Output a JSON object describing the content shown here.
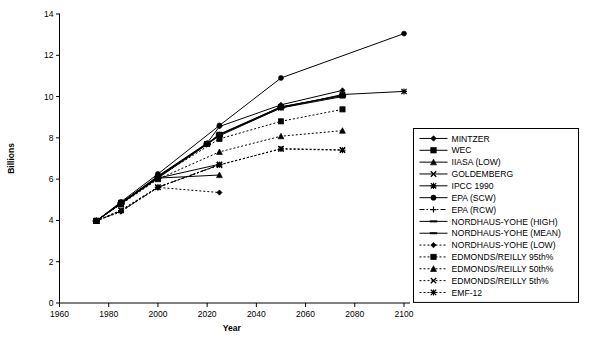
{
  "chart_data": {
    "type": "line",
    "title": "",
    "xlabel": "Year",
    "ylabel": "Billions",
    "xlim": [
      1960,
      2100
    ],
    "ylim": [
      0,
      14
    ],
    "xticks": [
      1960,
      1980,
      2000,
      2020,
      2040,
      2060,
      2080,
      2100
    ],
    "xtick_labels": [
      "1960",
      "1980",
      "2000",
      "2020",
      "2040",
      "2060",
      "2080",
      "2100"
    ],
    "yticks": [
      0,
      2,
      4,
      6,
      8,
      10,
      12,
      14
    ],
    "ytick_labels": [
      "0",
      "2",
      "4",
      "6",
      "8",
      "10",
      "12",
      "14"
    ],
    "grid": false,
    "legend_position": "right-outside",
    "series": [
      {
        "name": "MINTZER",
        "marker": "diamond",
        "dash": "solid",
        "x": [
          1975,
          1985,
          2000,
          2020,
          2025,
          2050,
          2075
        ],
        "values": [
          3.98,
          4.85,
          6.15,
          7.75,
          8.55,
          9.6,
          10.3
        ]
      },
      {
        "name": "WEC",
        "marker": "square",
        "dash": "solid",
        "x": [
          1975,
          1985,
          2000,
          2020,
          2025,
          2050,
          2075
        ],
        "values": [
          3.98,
          4.85,
          6.1,
          7.7,
          8.15,
          9.5,
          10.05
        ]
      },
      {
        "name": "IIASA (LOW)",
        "marker": "triangle",
        "dash": "solid",
        "x": [
          1975,
          1985,
          2000,
          2025
        ],
        "values": [
          3.98,
          4.82,
          6.05,
          6.2
        ]
      },
      {
        "name": "GOLDEMBERG",
        "marker": "x",
        "dash": "solid",
        "x": [
          1975,
          1985,
          2000,
          2025
        ],
        "values": [
          3.98,
          4.82,
          6.05,
          6.72
        ]
      },
      {
        "name": "IPCC 1990",
        "marker": "asterisk",
        "dash": "solid",
        "x": [
          1975,
          1985,
          2000,
          2020,
          2025,
          2050,
          2075,
          2100
        ],
        "values": [
          3.98,
          4.85,
          6.1,
          7.72,
          8.15,
          9.45,
          10.1,
          10.25
        ]
      },
      {
        "name": "EPA (SCW)",
        "marker": "circle",
        "dash": "solid",
        "x": [
          1975,
          1985,
          2000,
          2025,
          2050,
          2100
        ],
        "values": [
          3.98,
          4.9,
          6.25,
          8.6,
          10.9,
          13.05
        ]
      },
      {
        "name": "EPA (RCW)",
        "marker": "plus",
        "dash": "dashdot",
        "x": [
          1975,
          1985,
          2000,
          2025
        ],
        "values": [
          3.98,
          4.45,
          5.6,
          6.7
        ]
      },
      {
        "name": "NORDHAUS-YOHE (HIGH)",
        "marker": "dash",
        "dash": "solid",
        "x": [
          1975,
          1985,
          2000,
          2020,
          2025,
          2050,
          2075
        ],
        "values": [
          3.98,
          4.85,
          6.12,
          7.72,
          8.18,
          9.5,
          10.05
        ]
      },
      {
        "name": "NORDHAUS-YOHE (MEAN)",
        "marker": "dash",
        "dash": "solid",
        "x": [
          1975,
          1985,
          2000,
          2020,
          2025,
          2050,
          2075
        ],
        "values": [
          3.98,
          4.8,
          6.05,
          7.68,
          8.1,
          9.45,
          10.0
        ]
      },
      {
        "name": "NORDHAUS-YOHE (LOW)",
        "marker": "diamond",
        "dash": "dotted",
        "x": [
          1975,
          1985,
          2000,
          2025
        ],
        "values": [
          3.98,
          4.42,
          5.6,
          5.35
        ]
      },
      {
        "name": "EDMONDS/REILLY 95th%",
        "marker": "square",
        "dash": "dotted",
        "x": [
          1975,
          1985,
          2000,
          2025,
          2050,
          2075
        ],
        "values": [
          3.98,
          4.85,
          6.1,
          7.95,
          8.8,
          9.38
        ]
      },
      {
        "name": "EDMONDS/REILLY 50th%",
        "marker": "triangle",
        "dash": "dotted",
        "x": [
          1975,
          1985,
          2000,
          2025,
          2050,
          2075
        ],
        "values": [
          3.98,
          4.78,
          6.0,
          7.32,
          8.08,
          8.35
        ]
      },
      {
        "name": "EDMONDS/REILLY 5th%",
        "marker": "x",
        "dash": "dotted",
        "x": [
          1975,
          1985,
          2000,
          2025,
          2050,
          2075
        ],
        "values": [
          3.98,
          4.5,
          5.62,
          6.68,
          7.48,
          7.42
        ]
      },
      {
        "name": "EMF-12",
        "marker": "asterisk",
        "dash": "dotted",
        "x": [
          1975,
          1985,
          2000,
          2025,
          2050,
          2075
        ],
        "values": [
          3.98,
          4.48,
          5.6,
          6.7,
          7.46,
          7.4
        ]
      }
    ]
  }
}
